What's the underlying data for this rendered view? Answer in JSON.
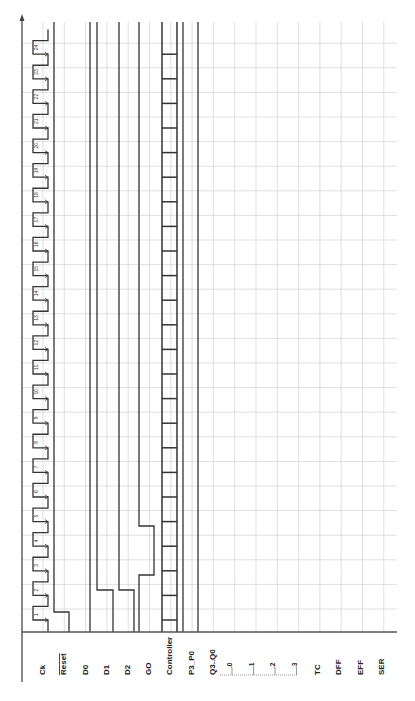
{
  "diagram": {
    "orientation": "rotated-90-ccw",
    "clock_cycles": 24,
    "signals": [
      {
        "name": "Ck",
        "overline": false
      },
      {
        "name": "Reset",
        "overline": true
      },
      {
        "name": "D0",
        "overline": false
      },
      {
        "name": "D1",
        "overline": false
      },
      {
        "name": "D2",
        "overline": false
      },
      {
        "name": "GO",
        "overline": false
      },
      {
        "name": "Controller",
        "overline": false
      },
      {
        "name": "P3_P0",
        "overline": false
      },
      {
        "name": "Q3..Q0",
        "overline": false
      },
      {
        "name": "TC",
        "overline": false
      },
      {
        "name": "DFF",
        "overline": false
      },
      {
        "name": "EFF",
        "overline": false
      },
      {
        "name": "SER",
        "overline": false
      }
    ],
    "q_sublabels": [
      ".0",
      ".1",
      ".2",
      ".3"
    ],
    "clock_labels": [
      "1",
      "2",
      "3",
      "4",
      "5",
      "6",
      "7",
      "8",
      "9",
      "10",
      "11",
      "12",
      "13",
      "14",
      "15",
      "16",
      "17",
      "18",
      "19",
      "20",
      "21",
      "22",
      "23",
      "24"
    ],
    "colors": {
      "wave": "#333333",
      "grid": "#d2d2d2",
      "axis": "#555555",
      "background": "#ffffff"
    }
  }
}
